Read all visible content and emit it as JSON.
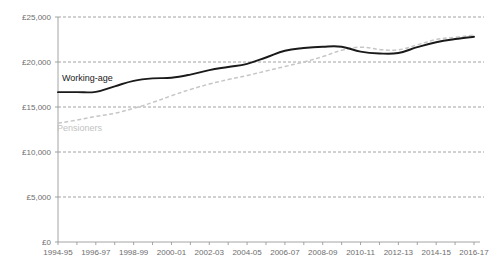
{
  "chart_data": {
    "type": "line",
    "title": "",
    "subtitle": "",
    "xlabel": "",
    "ylabel": "",
    "ylim": [
      0,
      25000
    ],
    "y_ticks": [
      0,
      5000,
      10000,
      15000,
      20000,
      25000
    ],
    "y_tick_labels": [
      "£0",
      "£5,000",
      "£10,000",
      "£15,000",
      "£20,000",
      "£25,000"
    ],
    "grid": true,
    "legend_position": "inline-annotation",
    "categories": [
      "1994-95",
      "1995-96",
      "1996-97",
      "1997-98",
      "1998-99",
      "1999-00",
      "2000-01",
      "2001-02",
      "2002-03",
      "2003-04",
      "2004-05",
      "2005-06",
      "2006-07",
      "2007-08",
      "2008-09",
      "2009-10",
      "2010-11",
      "2011-12",
      "2012-13",
      "2013-14",
      "2014-15",
      "2015-16",
      "2016-17"
    ],
    "x_tick_labels": [
      "1994-95",
      "1996-97",
      "1998-99",
      "2000-01",
      "2002-03",
      "2004-05",
      "2006-07",
      "2008-09",
      "2010-11",
      "2012-13",
      "2014-15",
      "2016-17"
    ],
    "series": [
      {
        "name": "Working-age",
        "style": "solid",
        "color": "#1a1a1a",
        "label_x_index": 1,
        "values": [
          16650,
          16650,
          16680,
          17300,
          17900,
          18180,
          18250,
          18600,
          19100,
          19450,
          19800,
          20500,
          21250,
          21550,
          21700,
          21700,
          21150,
          20950,
          21000,
          21650,
          22200,
          22550,
          22800
        ]
      },
      {
        "name": "Pensioners",
        "style": "dashed",
        "color": "#c6c6c6",
        "label_x_index": 0,
        "values": [
          13200,
          13550,
          13950,
          14300,
          14850,
          15500,
          16250,
          16950,
          17550,
          18050,
          18500,
          19000,
          19500,
          20000,
          20600,
          21300,
          21650,
          21400,
          21350,
          21900,
          22500,
          22750,
          23000
        ]
      }
    ]
  },
  "annotations": {
    "working_age_label": "Working-age",
    "pensioners_label": "Pensioners"
  }
}
